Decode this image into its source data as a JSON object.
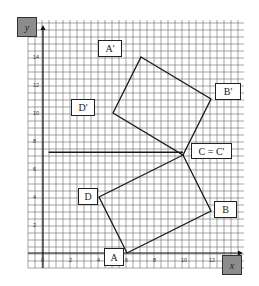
{
  "diagram": {
    "type": "coordinate-grid-rotation",
    "grid": {
      "x_min": -1,
      "x_max": 14.4,
      "y_min": -1.1,
      "y_max": 16.6,
      "unit_px": 14,
      "origin_px": [
        43,
        253
      ]
    },
    "axes": {
      "x_label": "x",
      "y_label": "y",
      "x_ticks": [
        {
          "value": 0,
          "label": "0"
        },
        {
          "value": 2,
          "label": "2"
        },
        {
          "value": 4,
          "label": "4"
        },
        {
          "value": 6,
          "label": "6"
        },
        {
          "value": 8,
          "label": "8"
        },
        {
          "value": 10,
          "label": "10"
        },
        {
          "value": 12,
          "label": "12"
        }
      ],
      "y_ticks": [
        {
          "value": 2,
          "label": "2"
        },
        {
          "value": 4,
          "label": "4"
        },
        {
          "value": 6,
          "label": "6"
        },
        {
          "value": 8,
          "label": "8"
        },
        {
          "value": 10,
          "label": "10"
        },
        {
          "value": 12,
          "label": "12"
        },
        {
          "value": 14,
          "label": "14"
        }
      ]
    },
    "original_shape": {
      "name": "ABCD",
      "vertices": [
        {
          "label": "A",
          "x": 6,
          "y": 0
        },
        {
          "label": "B",
          "x": 12,
          "y": 3
        },
        {
          "label": "C",
          "x": 10,
          "y": 7
        },
        {
          "label": "D",
          "x": 4,
          "y": 4
        }
      ]
    },
    "image_shape": {
      "name": "A'B'C'D'",
      "vertices": [
        {
          "label": "A'",
          "x": 7,
          "y": 14
        },
        {
          "label": "B'",
          "x": 12,
          "y": 11
        },
        {
          "label": "C'",
          "x": 10,
          "y": 7
        },
        {
          "label": "D'",
          "x": 5,
          "y": 10
        }
      ]
    },
    "reference_line": {
      "from": {
        "x": 0.4,
        "y": 7.2
      },
      "to": {
        "x": 10,
        "y": 7.2
      }
    },
    "labels": {
      "A": "A",
      "B": "B",
      "C": "C = C'",
      "D": "D",
      "A_prime": "A'",
      "B_prime": "B'",
      "D_prime": "D'"
    },
    "colors": {
      "grid": "#555555",
      "lines": "#1a1a1a",
      "axis_box": "#8c8c8c"
    }
  }
}
